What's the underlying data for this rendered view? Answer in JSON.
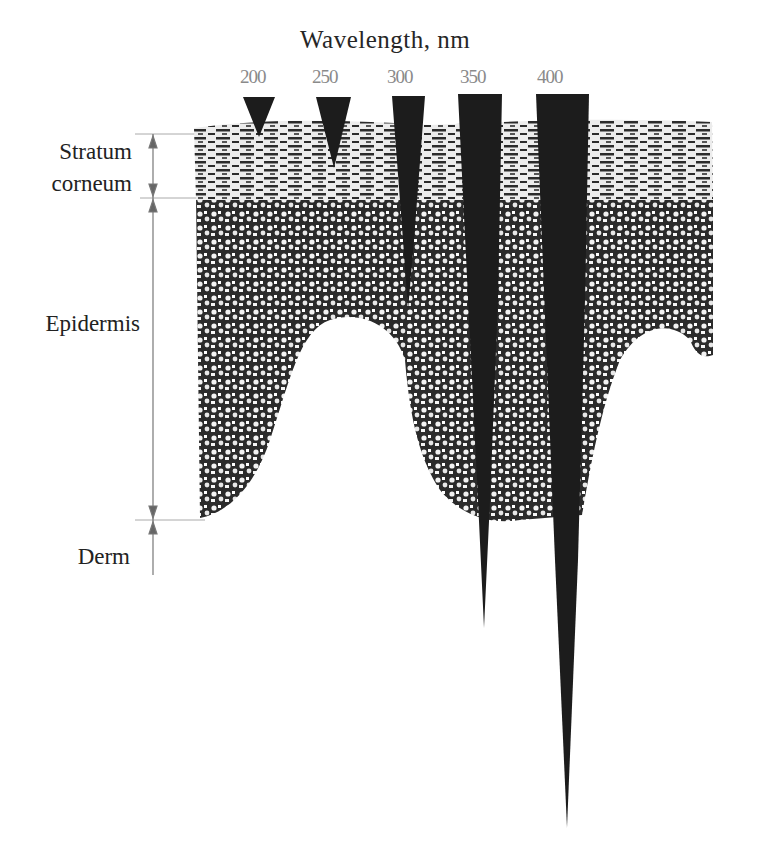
{
  "diagram": {
    "title": "Wavelength, nm",
    "wavelengths": [
      {
        "label": "200",
        "x": 259,
        "penetration_bottom_y": 137
      },
      {
        "label": "250",
        "x": 334,
        "penetration_bottom_y": 168
      },
      {
        "label": "300",
        "x": 408,
        "penetration_bottom_y": 300
      },
      {
        "label": "350",
        "x": 482,
        "penetration_bottom_y": 628
      },
      {
        "label": "400",
        "x": 562,
        "penetration_bottom_y": 828
      }
    ],
    "layers": [
      {
        "name": "Stratum corneum",
        "lines": [
          "Stratum",
          "corneum"
        ]
      },
      {
        "name": "Epidermis"
      },
      {
        "name": "Derm"
      }
    ],
    "colors": {
      "skin_tissue": "#2a2a2a",
      "beam": "#1a1a1a",
      "wavelength_label": "#8a8a8a",
      "guide_line": "#999999"
    }
  }
}
